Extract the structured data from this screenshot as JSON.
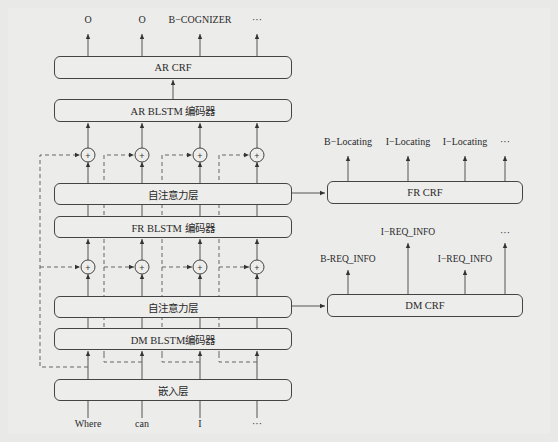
{
  "diagram": {
    "ar_crf": {
      "label": "AR CRF",
      "outputs": [
        "O",
        "O",
        "B−COGNIZER",
        "···"
      ]
    },
    "ar_blstm": {
      "label": "AR BLSTM 编码器"
    },
    "self_attention_upper": {
      "label": "自注意力层"
    },
    "fr_blstm": {
      "label": "FR BLSTM 编码器"
    },
    "self_attention_lower": {
      "label": "自注意力层"
    },
    "dm_blstm": {
      "label": "DM BLSTM编码器"
    },
    "embedding": {
      "label": "嵌入层"
    },
    "inputs": [
      "Where",
      "can",
      "I",
      "···"
    ],
    "fr_crf": {
      "label": "FR CRF",
      "outputs": [
        "B−Locating",
        "I−Locating",
        "I−Locating",
        "···"
      ]
    },
    "dm_crf": {
      "label": "DM CRF",
      "outputs": [
        "B-REQ_INFO",
        "I−REQ_INFO",
        "I−REQ_INFO",
        "···"
      ]
    },
    "add_symbol": "+"
  }
}
